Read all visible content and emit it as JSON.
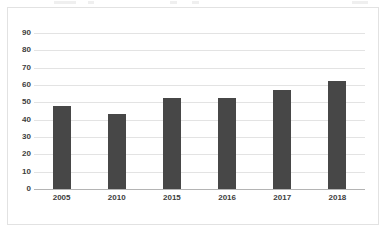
{
  "chart_data": {
    "type": "bar",
    "title": "",
    "subtitle": "",
    "xlabel": "",
    "ylabel": "",
    "categories": [
      "2005",
      "2010",
      "2015",
      "2016",
      "2017",
      "2018"
    ],
    "values": [
      48,
      43,
      52.5,
      52.5,
      57,
      62.5
    ],
    "series": [
      {
        "name": "",
        "values": [
          48,
          43,
          52.5,
          52.5,
          57,
          62.5
        ]
      }
    ],
    "ylim": [
      0,
      90
    ],
    "ytick_labels": [
      "90",
      "80",
      "70",
      "60",
      "50",
      "40",
      "30",
      "20",
      "10",
      "0"
    ],
    "ytick_values": [
      90,
      80,
      70,
      60,
      50,
      40,
      30,
      20,
      10,
      0
    ],
    "ytick_step": 10,
    "grid": true,
    "grid_axis": "y",
    "legend": false,
    "legend_position": "none",
    "bar_color": "#474747",
    "gridline_color": "#e3e3e3",
    "axis_color": "#b4b4b4",
    "border_color": "#e2e2e2",
    "background_color": "#ffffff",
    "label_color": "#3d3d3d"
  }
}
